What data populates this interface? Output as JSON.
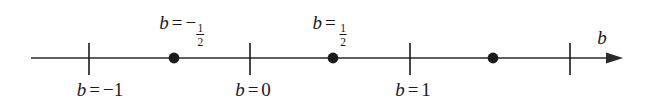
{
  "figure": {
    "type": "number-line",
    "axis_variable": "b",
    "background_color": "#ffffff",
    "ink_color": "#1a1a1a"
  },
  "axis": {
    "variable_label": "b",
    "line_start_x": 31,
    "line_end_x": 623,
    "line_y": 58,
    "arrow": "right",
    "variable_label_x": 602,
    "variable_label_y": 37
  },
  "ticks": [
    {
      "name": "tick-b-minus-1",
      "x": 89,
      "value": -1,
      "label_below": true
    },
    {
      "name": "tick-b-0",
      "x": 250,
      "value": 0,
      "label_below": true
    },
    {
      "name": "tick-b-1",
      "x": 410,
      "value": 1,
      "label_below": true
    },
    {
      "name": "tick-b-2",
      "x": 570,
      "value": 2,
      "label_below": false
    }
  ],
  "points": [
    {
      "name": "point-b-minus-half",
      "x": 174,
      "value": -0.5,
      "filled": true
    },
    {
      "name": "point-b-half",
      "x": 333,
      "value": 0.5,
      "filled": true
    },
    {
      "name": "point-b-three-half",
      "x": 493,
      "value": 1.5,
      "filled": true
    }
  ],
  "labels_above": [
    {
      "name": "label-b-equals-minus-one-half",
      "x": 182,
      "y": 23,
      "var": "b",
      "rel": "=",
      "sign": "−",
      "numerator": "1",
      "denominator": "2",
      "text": "b = −1/2"
    },
    {
      "name": "label-b-equals-one-half",
      "x": 330,
      "y": 23,
      "var": "b",
      "rel": "=",
      "sign": "",
      "numerator": "1",
      "denominator": "2",
      "text": "b = 1/2"
    }
  ],
  "labels_below": [
    {
      "name": "label-b-equals-minus-one",
      "x": 100,
      "y": 90,
      "var": "b",
      "rel": "=",
      "value_text": "−1",
      "text": "b = −1"
    },
    {
      "name": "label-b-equals-zero",
      "x": 253,
      "y": 90,
      "var": "b",
      "rel": "=",
      "value_text": "0",
      "text": "b = 0"
    },
    {
      "name": "label-b-equals-one",
      "x": 413,
      "y": 90,
      "var": "b",
      "rel": "=",
      "value_text": "1",
      "text": "b = 1"
    }
  ]
}
